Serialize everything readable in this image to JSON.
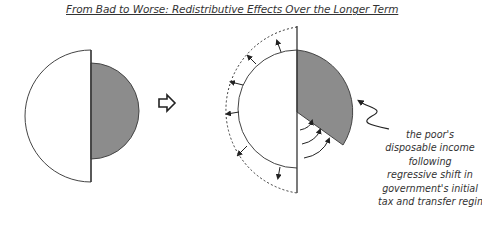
{
  "title": "From Bad to Worse: Redistributive Effects Over the Longer Term",
  "colors": {
    "fill_grey": "#8c8c8c",
    "stroke": "#333333",
    "background": "#ffffff"
  },
  "figures": {
    "before": {
      "label": "initial distribution",
      "grey_share": "right half (poor's disposable income)"
    },
    "transition_icon": "right-arrow-outline",
    "after": {
      "label": "longer-term distribution",
      "grey_share": "shrunken wedge"
    }
  },
  "caption_lines": [
    "the poor's",
    "disposable income",
    "following",
    "regressive shift in",
    "government's initial",
    "tax and transfer regime"
  ]
}
